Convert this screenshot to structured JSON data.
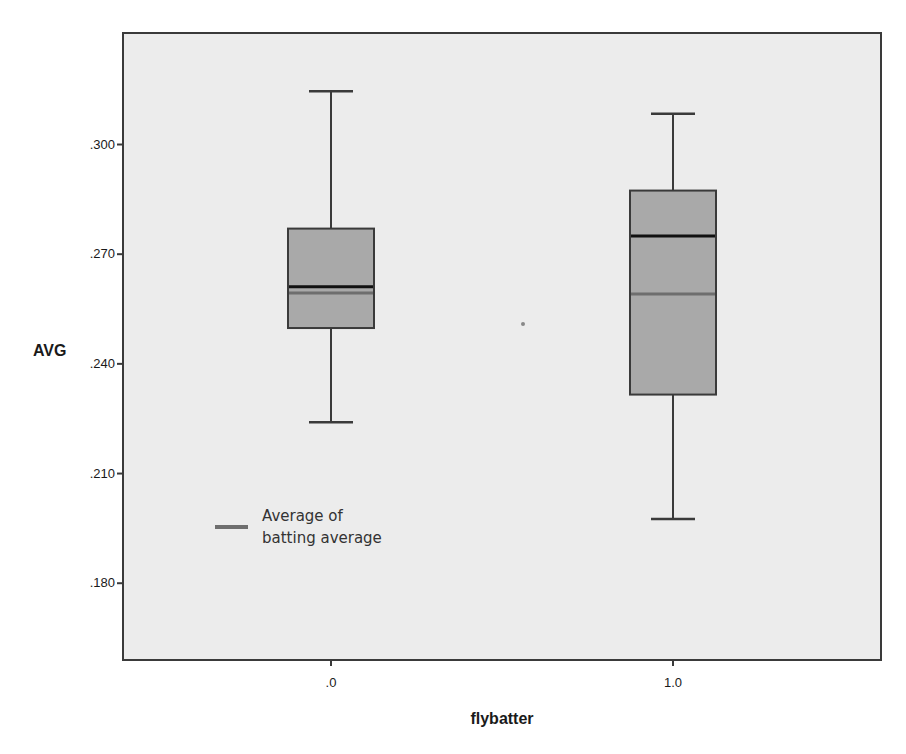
{
  "chart_data": {
    "type": "box",
    "title": "",
    "xlabel": "flybatter",
    "ylabel": "AVG",
    "categories": [
      ".0",
      "1.0"
    ],
    "ylim": [
      0.159,
      0.3305
    ],
    "yticks": [
      0.3,
      0.27,
      0.24,
      0.21,
      0.18
    ],
    "ytick_labels": [
      ".300",
      ".270",
      ".240",
      ".210",
      ".180"
    ],
    "grid": false,
    "series": [
      {
        "category": ".0",
        "whisker_high": 0.3146,
        "q3": 0.277,
        "median": 0.2611,
        "mean": 0.2594,
        "q1": 0.2498,
        "whisker_low": 0.224
      },
      {
        "category": "1.0",
        "whisker_high": 0.3084,
        "q3": 0.2874,
        "median": 0.275,
        "mean": 0.2591,
        "q1": 0.2316,
        "whisker_low": 0.1976
      }
    ],
    "reference_lines": [
      {
        "name": "Average of batting average",
        "value": 0.2592,
        "style": "gray line inside boxes"
      }
    ],
    "legend": {
      "position": "inside-lower-left",
      "entries": [
        {
          "label_line1": "Average of",
          "label_line2": "batting average",
          "color": "#6e6e6e"
        }
      ]
    },
    "colors": {
      "plot_background": "#ececec",
      "box_fill": "#a9a9a9",
      "box_stroke": "#3a3a3a",
      "median_line": "#111111",
      "mean_line": "#6e6e6e",
      "frame": "#3a3a3a"
    }
  }
}
